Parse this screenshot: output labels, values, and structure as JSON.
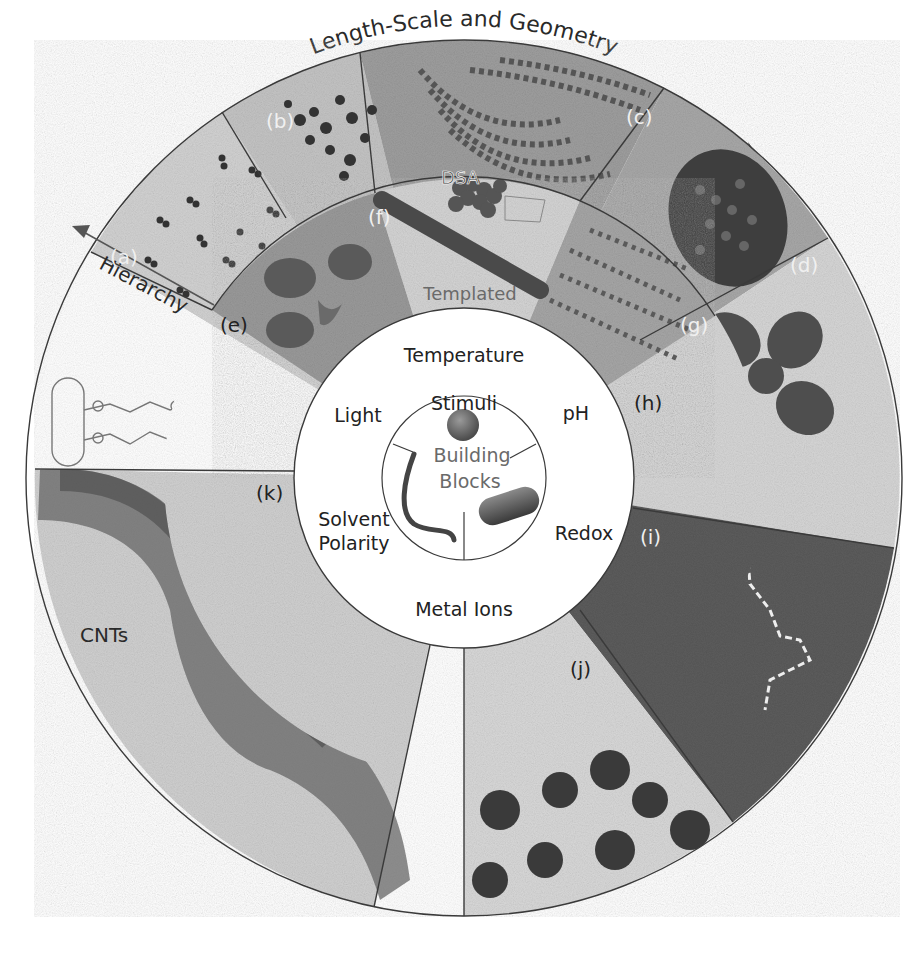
{
  "figure": {
    "title_arc": "Length-Scale and Geometry",
    "hierarchy_label": "Hierarchy",
    "center": {
      "stimuli_label": "Stimuli",
      "building_blocks_line1": "Building",
      "building_blocks_line2": "Blocks"
    },
    "stimuli": {
      "temperature": "Temperature",
      "ph": "pH",
      "redox": "Redox",
      "metal_ions": "Metal Ions",
      "solvent_line1": "Solvent",
      "solvent_line2": "Polarity",
      "light": "Light"
    },
    "inner_ring_labels": {
      "dsa": "DSA",
      "templated": "Templated"
    },
    "panels": {
      "a": "(a)",
      "b": "(b)",
      "c": "(c)",
      "d": "(d)",
      "e": "(e)",
      "f": "(f)",
      "g": "(g)",
      "h": "(h)",
      "i": "(i)",
      "j": "(j)",
      "k": "(k)"
    },
    "cnts_label": "CNTs",
    "colors": {
      "ring_outline": "#3a3a3a",
      "panel_light": "#d9d9d9",
      "panel_mid": "#b8b8b8",
      "panel_dark": "#5e5e5e",
      "arrow": "#555555"
    }
  }
}
